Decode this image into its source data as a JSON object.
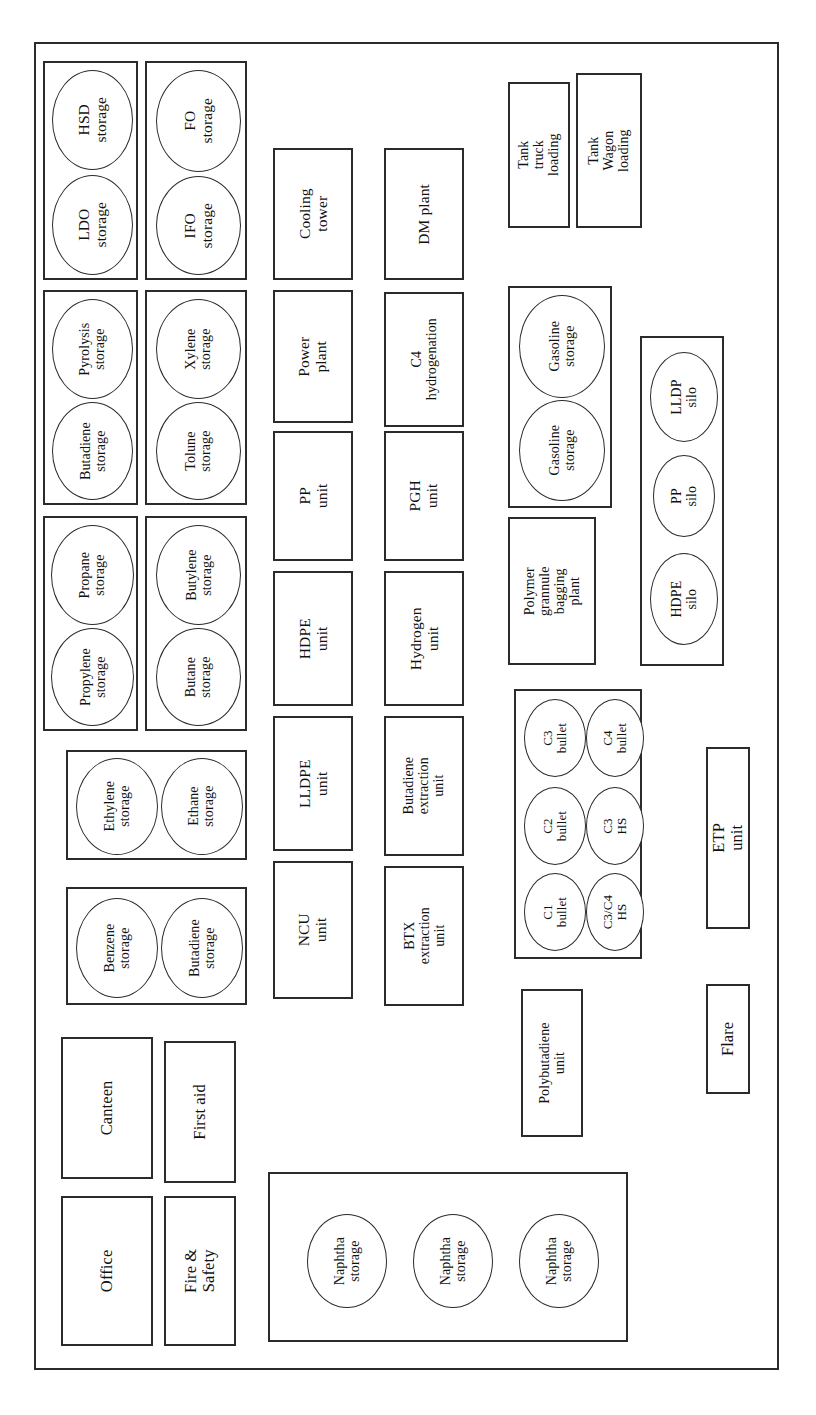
{
  "diagram": {
    "orientation": "rotated-90-ccw",
    "stroke_color": "#2b2b2b",
    "background_color": "#ffffff"
  },
  "groups": {
    "hsd_ldo": {
      "name": "HSD / LDO storage group"
    },
    "fo_ifo": {
      "name": "FO / IFO storage group"
    },
    "pyro_buta": {
      "name": "Pyrolysis / Butadiene storage group"
    },
    "xylene_tolune": {
      "name": "Xylene / Tolune storage group"
    },
    "propane_propylene": {
      "name": "Propane / Propylene storage group"
    },
    "butylene_butane": {
      "name": "Butylene / Butane storage group"
    },
    "ethylene_ethane": {
      "name": "Ethylene / Ethane storage group"
    },
    "benzene_butadiene": {
      "name": "Benzene / Butadiene storage group"
    },
    "gasoline": {
      "name": "Gasoline storage group"
    },
    "silos": {
      "name": "Polymer silo group"
    },
    "bullets": {
      "name": "Bullet storage group"
    },
    "naphtha": {
      "name": "Naphtha storage group"
    }
  },
  "tanks": {
    "hsd": "HSD\nstorage",
    "ldo": "LDO\nstorage",
    "fo": "FO\nstorage",
    "ifo": "IFO\nstorage",
    "pyrolysis": "Pyrolysis\nstorage",
    "butadiene_a": "Butadiene\nstorage",
    "xylene": "Xylene\nstorage",
    "tolune": "Tolune\nstorage",
    "propane": "Propane\nstorage",
    "propylene": "Propylene\nstorage",
    "butylene": "Butylene\nstorage",
    "butane": "Butane\nstorage",
    "ethylene": "Ethylene\nstorage",
    "ethane": "Ethane\nstorage",
    "benzene": "Benzene\nstorage",
    "butadiene_b": "Butadiene\nstorage",
    "gasoline_1": "Gasoline\nstorage",
    "gasoline_2": "Gasoline\nstorage",
    "lldp_silo": "LLDP\nsilo",
    "pp_silo": "PP\nsilo",
    "hdpe_silo": "HDPE\nsilo",
    "c3_bullet": "C3\nbullet",
    "c2_bullet": "C2\nbullet",
    "c1_bullet": "C1\nbullet",
    "c4_bullet": "C4\nbullet",
    "c3_hs": "C3\nHS",
    "c3c4_hs": "C3/C4\nHS",
    "naphtha_1": "Naphtha\nstorage",
    "naphtha_2": "Naphtha\nstorage",
    "naphtha_3": "Naphtha\nstorage"
  },
  "blocks": {
    "cooling_tower": "Cooling\ntower",
    "power_plant": "Power\nplant",
    "pp_unit": "PP\nunit",
    "hdpe_unit": "HDPE\nunit",
    "lldpe_unit": "LLDPE\nunit",
    "ncu_unit": "NCU\nunit",
    "dm_plant": "DM plant",
    "c4_hydrogenation": "C4\nhydrogenation",
    "pgh_unit": "PGH\nunit",
    "hydrogen_unit": "Hydrogen\nunit",
    "butadiene_extraction_unit": "Butadiene\nextraction\nunit",
    "btx_extraction_unit": "BTX\nextraction\nunit",
    "tank_truck_loading": "Tank truck\nloading",
    "tank_wagon_loading": "Tank Wagon\nloading",
    "polymer_bagging_plant": "Polymer\ngrannule\nbagging\nplant",
    "polybutadiene_unit": "Polybutadiene\nunit",
    "etp_unit": "ETP unit",
    "flare": "Flare",
    "canteen": "Canteen",
    "first_aid": "First aid",
    "office": "Office",
    "fire_and_safety": "Fire & Safety"
  }
}
